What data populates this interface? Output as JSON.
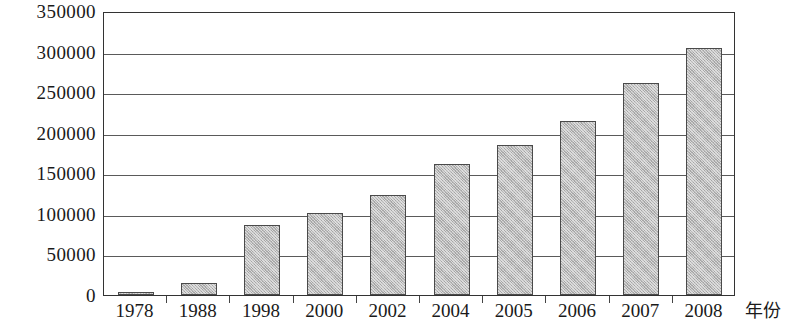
{
  "chart_data": {
    "type": "bar",
    "title": "",
    "subtitle": "",
    "xlabel": "年份",
    "ylabel": "",
    "categories": [
      "1978",
      "1988",
      "1998",
      "2000",
      "2002",
      "2004",
      "2005",
      "2006",
      "2007",
      "2008"
    ],
    "values": [
      4000,
      15000,
      86000,
      101000,
      123000,
      162000,
      185000,
      215000,
      261000,
      305000
    ],
    "series": [
      {
        "name": "",
        "values": [
          4000,
          15000,
          86000,
          101000,
          123000,
          162000,
          185000,
          215000,
          261000,
          305000
        ]
      }
    ],
    "ylim": [
      0,
      350000
    ],
    "ytick_values": [
      0,
      50000,
      100000,
      150000,
      200000,
      250000,
      300000,
      350000
    ],
    "ytick_labels": [
      "0",
      "50000",
      "100000",
      "150000",
      "200000",
      "250000",
      "300000",
      "350000"
    ],
    "grid": true,
    "grid_axis": "y",
    "legend": false,
    "legend_position": "none",
    "bar_fill_color": "#b9b9b9",
    "bar_border_color": "#4a4a4a",
    "axis_color": "#333333",
    "gridline_color": "#5a5a5a",
    "text_color": "#1a1a1a"
  }
}
